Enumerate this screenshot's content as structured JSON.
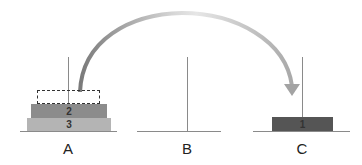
{
  "diagram": {
    "pegs": [
      {
        "label": "A"
      },
      {
        "label": "B"
      },
      {
        "label": "C"
      }
    ],
    "disks": [
      {
        "label": "1",
        "peg": "C",
        "color": "#555555"
      },
      {
        "label": "2",
        "peg": "A",
        "color": "#8c8c8c"
      },
      {
        "label": "3",
        "peg": "A",
        "color": "#b4b4b4"
      }
    ],
    "ghost_disk": {
      "peg": "A",
      "description": "dashed outline where disk 1 was"
    },
    "arrow": {
      "from": "A",
      "to": "C",
      "description": "curved move arrow"
    }
  }
}
